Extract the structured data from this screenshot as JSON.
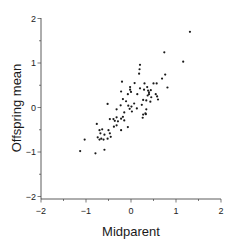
{
  "chart_data": {
    "type": "scatter",
    "title": "",
    "xlabel": "Midparent",
    "ylabel": "Offspring mean",
    "xlim": [
      -2,
      2
    ],
    "ylim": [
      -2,
      2
    ],
    "xticks": [
      -2,
      -1,
      0,
      1,
      2
    ],
    "yticks": [
      -2,
      -1,
      0,
      1,
      2
    ],
    "xtick_labels": [
      "−2",
      "−1",
      "0",
      "1",
      "2"
    ],
    "ytick_labels": [
      "−2",
      "−1",
      "0",
      "1",
      "2"
    ],
    "grid": false,
    "legend": null,
    "marker_color": "#1a1a1a",
    "points": [
      [
        1.31,
        1.7
      ],
      [
        0.74,
        1.24
      ],
      [
        1.16,
        1.03
      ],
      [
        0.2,
        0.96
      ],
      [
        0.19,
        0.86
      ],
      [
        0.18,
        0.76
      ],
      [
        0.76,
        0.74
      ],
      [
        0.69,
        0.65
      ],
      [
        0.5,
        0.54
      ],
      [
        0.57,
        0.54
      ],
      [
        0.3,
        0.54
      ],
      [
        0.36,
        0.46
      ],
      [
        0.81,
        0.45
      ],
      [
        0.08,
        0.55
      ],
      [
        -0.2,
        0.58
      ],
      [
        -0.02,
        0.46
      ],
      [
        -0.02,
        0.4
      ],
      [
        0.0,
        0.35
      ],
      [
        -0.22,
        0.36
      ],
      [
        -0.07,
        0.3
      ],
      [
        0.2,
        0.43
      ],
      [
        0.29,
        0.4
      ],
      [
        0.38,
        0.38
      ],
      [
        0.44,
        0.39
      ],
      [
        0.14,
        0.3
      ],
      [
        0.4,
        0.3
      ],
      [
        0.55,
        0.3
      ],
      [
        0.58,
        0.25
      ],
      [
        0.6,
        0.18
      ],
      [
        0.45,
        0.23
      ],
      [
        0.37,
        0.27
      ],
      [
        0.34,
        0.16
      ],
      [
        0.27,
        0.17
      ],
      [
        0.43,
        0.13
      ],
      [
        0.24,
        0.06
      ],
      [
        0.07,
        0.09
      ],
      [
        0.01,
        0.02
      ],
      [
        -0.06,
        0.04
      ],
      [
        -0.03,
        -0.03
      ],
      [
        0.02,
        -0.09
      ],
      [
        -0.11,
        0.14
      ],
      [
        -0.18,
        0.19
      ],
      [
        -0.23,
        0.05
      ],
      [
        -0.32,
        -0.04
      ],
      [
        -0.52,
        0.08
      ],
      [
        -0.15,
        -0.11
      ],
      [
        -0.18,
        -0.21
      ],
      [
        -0.15,
        -0.29
      ],
      [
        -0.07,
        -0.44
      ],
      [
        0.13,
        -0.02
      ],
      [
        0.27,
        -0.16
      ],
      [
        0.32,
        -0.13
      ],
      [
        0.34,
        -0.04
      ],
      [
        -0.32,
        -0.22
      ],
      [
        -0.36,
        -0.3
      ],
      [
        -0.39,
        -0.26
      ],
      [
        -0.29,
        -0.31
      ],
      [
        -0.22,
        -0.25
      ],
      [
        -0.32,
        -0.4
      ],
      [
        -0.22,
        -0.51
      ],
      [
        -0.47,
        -0.26
      ],
      [
        -0.38,
        -0.43
      ],
      [
        -0.5,
        -0.51
      ],
      [
        -0.47,
        -0.58
      ],
      [
        -0.45,
        -0.66
      ],
      [
        -0.64,
        -0.49
      ],
      [
        -0.59,
        -0.61
      ],
      [
        -0.7,
        -0.51
      ],
      [
        -0.68,
        -0.58
      ],
      [
        -0.76,
        -0.37
      ],
      [
        -0.61,
        -0.72
      ],
      [
        -0.52,
        -0.7
      ],
      [
        -0.74,
        -0.67
      ],
      [
        -0.66,
        -0.7
      ],
      [
        -0.7,
        -0.72
      ],
      [
        -0.59,
        -0.95
      ],
      [
        -0.79,
        -1.03
      ],
      [
        -1.03,
        -0.72
      ],
      [
        -1.13,
        -0.98
      ],
      [
        0.26,
        -0.23
      ],
      [
        0.33,
        -0.15
      ],
      [
        0.4,
        0.34
      ]
    ]
  }
}
